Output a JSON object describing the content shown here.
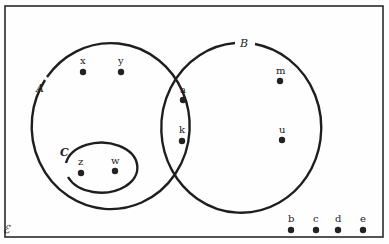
{
  "diagram": {
    "type": "venn",
    "universal_set": {
      "label": "ℰ"
    },
    "sets": [
      {
        "name": "A",
        "label": "A",
        "elements": [
          "x",
          "y",
          "a",
          "k",
          "z",
          "w"
        ]
      },
      {
        "name": "B",
        "label": "B",
        "elements": [
          "a",
          "k",
          "m",
          "u"
        ]
      },
      {
        "name": "C",
        "label": "C",
        "elements": [
          "z",
          "w"
        ],
        "subset_of": "A"
      }
    ],
    "points": [
      {
        "label": "x",
        "x": 83,
        "y": 72
      },
      {
        "label": "y",
        "x": 121,
        "y": 72
      },
      {
        "label": "a",
        "x": 183,
        "y": 100
      },
      {
        "label": "k",
        "x": 182,
        "y": 141
      },
      {
        "label": "z",
        "x": 81,
        "y": 173
      },
      {
        "label": "w",
        "x": 115,
        "y": 171
      },
      {
        "label": "m",
        "x": 280,
        "y": 81
      },
      {
        "label": "u",
        "x": 282,
        "y": 140
      },
      {
        "label": "b",
        "x": 291,
        "y": 230
      },
      {
        "label": "c",
        "x": 316,
        "y": 230
      },
      {
        "label": "d",
        "x": 338,
        "y": 230
      },
      {
        "label": "e",
        "x": 363,
        "y": 230
      }
    ],
    "outside_elements": [
      "b",
      "c",
      "d",
      "e"
    ],
    "line_color": "#1e1e1e",
    "background": "#fefefe"
  }
}
